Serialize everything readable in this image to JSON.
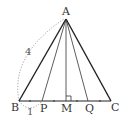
{
  "diagram": {
    "type": "geometry",
    "points": {
      "A": "A",
      "B": "B",
      "C": "C",
      "P": "P",
      "M": "M",
      "Q": "Q"
    },
    "segments": [
      "AB",
      "AC",
      "BC",
      "AM",
      "AP",
      "AQ"
    ],
    "right_angle_at": "M",
    "equal_segment_ticks": [
      "BP",
      "PM",
      "MQ",
      "QC"
    ],
    "annotations": {
      "AB_length": "4",
      "BP_length": "1"
    },
    "colors": {
      "stroke": "#222222",
      "dotted": "#888888",
      "text": "#333333"
    }
  }
}
